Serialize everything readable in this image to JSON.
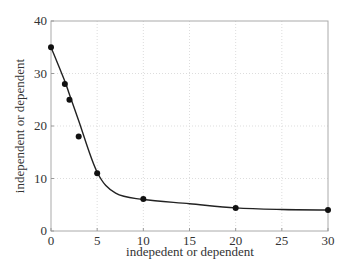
{
  "chart_data": {
    "type": "line",
    "title": "",
    "xlabel": "indepedent or dependent",
    "ylabel": "independent or dependent",
    "xlim": [
      0,
      30
    ],
    "ylim": [
      0,
      40
    ],
    "xticks": [
      0,
      5,
      10,
      15,
      20,
      25,
      30
    ],
    "yticks": [
      0,
      10,
      20,
      30,
      40
    ],
    "grid": true,
    "legend": null,
    "series": [
      {
        "name": "data",
        "style": "markers",
        "color": "#111111",
        "x": [
          0,
          1.5,
          2,
          3,
          5,
          10,
          20,
          30
        ],
        "y": [
          35,
          28,
          25,
          18,
          11,
          6.1,
          4.4,
          4.0
        ]
      },
      {
        "name": "fit",
        "style": "smooth-line",
        "color": "#222222",
        "x": [
          0,
          1.5,
          2,
          3,
          5,
          7,
          10,
          15,
          20,
          25,
          30
        ],
        "y": [
          35,
          28.5,
          26,
          21,
          11.2,
          7.2,
          6.0,
          5.2,
          4.4,
          4.1,
          4.0
        ]
      }
    ]
  }
}
